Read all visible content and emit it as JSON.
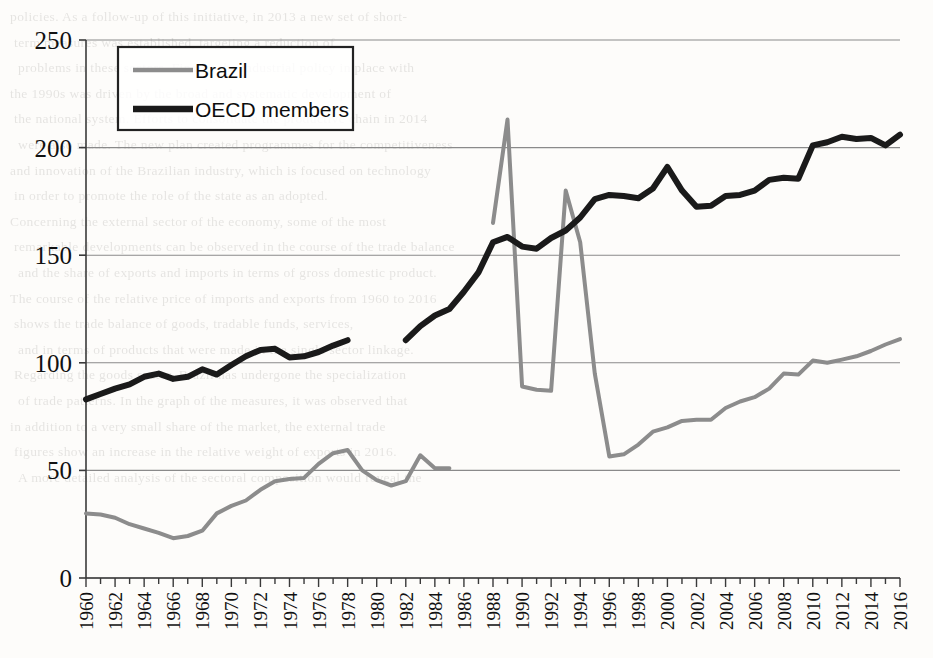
{
  "figure": {
    "background_color": "#fdfcfa",
    "plot_border_color": "#4a4a4a",
    "gridline_color": "#8a8a8a"
  },
  "legend": {
    "position": "top-left-inside",
    "entries": [
      {
        "label": "Brazil",
        "color": "#8c8c8c",
        "swatch_name": "legend-swatch-brazil"
      },
      {
        "label": "OECD members",
        "color": "#1a1a1a",
        "swatch_name": "legend-swatch-oecd"
      }
    ]
  },
  "scan_text": {
    "lines": [
      "policies. As a follow-up of this initiative, in 2013 a new set of short-",
      "term measures was established, targeting a reduction of",
      "problems in these sectors. Finally, the industrial policy in place with",
      "the 1990s was driven by the broad and systematic development of",
      "the national system. Efforts to consolidate the productive chain in 2014",
      "were also made. The new plan created programmes for the competitiveness",
      "and innovation of the Brazilian industry, which is focused on technology",
      "in order to promote the role of the state as an adopted.",
      "",
      "Concerning the external sector of the economy, some of the most",
      "remarkable developments can be observed in the course of the trade balance",
      "and the share of exports and imports in terms of gross domestic product.",
      "The course of the relative price of imports and exports from 1960 to 2016",
      "shows the trade balance of goods, tradable funds, services,",
      "and in terms of products that were made in the single sector linkage.",
      "",
      "Regarding the goods sector, Brazil has undergone the specialization",
      "of trade patterns. In the graph of the measures, it was observed that",
      "in addition to a very small share of the market, the external trade",
      "figures show an increase in the relative weight of exports in 2016.",
      "",
      "",
      "",
      "",
      "",
      "",
      "A more detailed analysis of the sectoral composition would reveal the"
    ]
  },
  "chart_data": {
    "type": "line",
    "title": "",
    "xlabel": "",
    "ylabel": "",
    "xlim": [
      1960,
      2016
    ],
    "ylim": [
      0,
      250
    ],
    "yticks": [
      0,
      50,
      100,
      150,
      200,
      250
    ],
    "ytick_labels": [
      "0",
      "50",
      "100",
      "150",
      "200",
      "250"
    ],
    "grid": true,
    "grid_axis": "y",
    "x": [
      1960,
      1961,
      1962,
      1963,
      1964,
      1965,
      1966,
      1967,
      1968,
      1969,
      1970,
      1971,
      1972,
      1973,
      1974,
      1975,
      1976,
      1977,
      1978,
      1979,
      1980,
      1981,
      1982,
      1983,
      1984,
      1985,
      1986,
      1987,
      1988,
      1989,
      1990,
      1991,
      1992,
      1993,
      1994,
      1995,
      1996,
      1997,
      1998,
      1999,
      2000,
      2001,
      2002,
      2003,
      2004,
      2005,
      2006,
      2007,
      2008,
      2009,
      2010,
      2011,
      2012,
      2013,
      2014,
      2015,
      2016
    ],
    "xticks": [
      1960,
      1962,
      1964,
      1966,
      1968,
      1970,
      1972,
      1974,
      1976,
      1978,
      1980,
      1982,
      1984,
      1986,
      1988,
      1990,
      1992,
      1994,
      1996,
      1998,
      2000,
      2002,
      2004,
      2006,
      2008,
      2010,
      2012,
      2014,
      2016
    ],
    "xtick_labels": [
      "1960",
      "1962",
      "1964",
      "1966",
      "1968",
      "1970",
      "1972",
      "1974",
      "1976",
      "1978",
      "1980",
      "1982",
      "1984",
      "1986",
      "1988",
      "1990",
      "1992",
      "1994",
      "1996",
      "1998",
      "2000",
      "2002",
      "2004",
      "2006",
      "2008",
      "2010",
      "2012",
      "2014",
      "2016"
    ],
    "series": [
      {
        "name": "Brazil",
        "color": "#8c8c8c",
        "line_width": 4.0,
        "values": [
          30,
          29.5,
          28,
          25,
          23,
          21,
          18.5,
          19.5,
          22,
          30,
          33.5,
          36,
          41,
          45,
          46,
          46.5,
          53,
          58,
          59.5,
          50,
          45.5,
          43,
          45,
          57,
          51,
          51,
          null,
          null,
          165,
          213,
          89,
          87.5,
          87,
          180,
          156,
          95,
          56.5,
          57.5,
          62,
          68,
          70,
          73,
          73.5,
          73.5,
          79,
          82,
          84,
          88,
          95,
          94.5,
          101,
          100,
          101.5,
          103,
          105.5,
          108.5,
          111
        ]
      },
      {
        "name": "OECD members",
        "color": "#1a1a1a",
        "line_width": 6.0,
        "values": [
          83,
          85.5,
          88,
          90,
          93.5,
          95,
          92.5,
          93.5,
          97,
          94.5,
          99,
          103,
          106,
          106.5,
          102.5,
          103,
          105,
          108,
          110.5,
          null,
          null,
          null,
          110.5,
          117,
          122,
          125,
          133,
          142,
          156,
          158.5,
          154,
          153,
          158,
          161.5,
          167.5,
          176,
          178,
          177.5,
          176.5,
          181,
          191,
          180,
          172.5,
          173,
          177.5,
          178,
          180,
          185,
          186,
          185.5,
          201,
          202.5,
          205,
          204,
          204.5,
          201,
          206
        ]
      }
    ]
  }
}
